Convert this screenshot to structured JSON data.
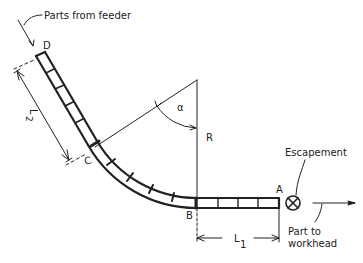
{
  "diagram": {
    "labels": {
      "parts_from_feeder": "Parts from feeder",
      "point_d": "D",
      "point_c": "C",
      "point_b": "B",
      "point_a": "A",
      "dim_l2": "L",
      "dim_l2_sub": "2",
      "dim_l1": "L",
      "dim_l1_sub": "1",
      "radius": "R",
      "angle": "α",
      "escapement": "Escapement",
      "part_to_workhead_1": "Part to",
      "part_to_workhead_2": "workhead"
    },
    "components": [
      "straight chute D-C",
      "curved chute C-B (radius R, angle α)",
      "straight chute B-A",
      "escapement",
      "output arrow to workhead"
    ],
    "colors": {
      "line": "#222222",
      "background": "#ffffff"
    }
  }
}
